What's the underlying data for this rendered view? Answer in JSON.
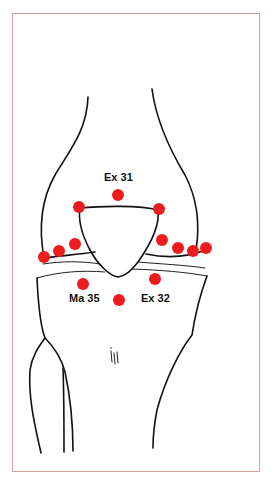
{
  "figure": {
    "border_color": "#d9a0a0",
    "point_color": "#ee1c1c",
    "labels": {
      "ex31": "Ex 31",
      "ma35": "Ma 35",
      "ex32": "Ex 32"
    },
    "points": [
      {
        "id": "ex31",
        "x": 118,
        "y": 195
      },
      {
        "id": "patella-top-left",
        "x": 79,
        "y": 207
      },
      {
        "id": "patella-top-right",
        "x": 159,
        "y": 209
      },
      {
        "id": "left-1",
        "x": 44,
        "y": 257
      },
      {
        "id": "left-2",
        "x": 59,
        "y": 251
      },
      {
        "id": "left-3",
        "x": 75,
        "y": 244
      },
      {
        "id": "right-1",
        "x": 162,
        "y": 240
      },
      {
        "id": "right-2",
        "x": 178,
        "y": 248
      },
      {
        "id": "right-3",
        "x": 193,
        "y": 251
      },
      {
        "id": "right-4",
        "x": 206,
        "y": 248
      },
      {
        "id": "ma35",
        "x": 83,
        "y": 284
      },
      {
        "id": "center-below",
        "x": 119,
        "y": 300
      },
      {
        "id": "ex32",
        "x": 155,
        "y": 279
      }
    ]
  }
}
